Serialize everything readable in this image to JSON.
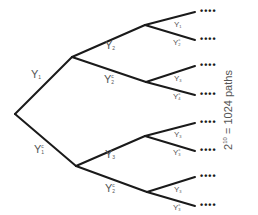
{
  "diagram": {
    "type": "binary-tree",
    "edge_color": "#1a1a1a",
    "label_color": "#555555",
    "root": {
      "x": 15,
      "y": 114
    },
    "level1": [
      {
        "label": "Y",
        "sub": "1",
        "sup": "",
        "from": [
          15,
          114
        ],
        "to": [
          72,
          57
        ],
        "lx": 37,
        "ly": 72
      },
      {
        "label": "Y",
        "sub": "1",
        "sup": "c",
        "from": [
          15,
          114
        ],
        "to": [
          76,
          166
        ],
        "lx": 40,
        "ly": 147
      }
    ],
    "level2": [
      {
        "label": "Y",
        "sub": "2",
        "sup": "",
        "from": [
          72,
          57
        ],
        "to": [
          145,
          25
        ],
        "lx": 111,
        "ly": 43
      },
      {
        "label": "Y",
        "sub": "2",
        "sup": "c",
        "from": [
          72,
          57
        ],
        "to": [
          146,
          82
        ],
        "lx": 110,
        "ly": 77
      },
      {
        "label": "Y",
        "sub": "3",
        "sup": "",
        "from": [
          76,
          166
        ],
        "to": [
          145,
          136
        ],
        "lx": 111,
        "ly": 152
      },
      {
        "label": "Y",
        "sub": "2",
        "sup": "c",
        "from": [
          76,
          166
        ],
        "to": [
          147,
          192
        ],
        "lx": 111,
        "ly": 186
      }
    ],
    "level3": [
      {
        "label": "Y",
        "sub": "1",
        "sup": "",
        "from": [
          145,
          25
        ],
        "to": [
          195,
          12
        ],
        "lx": 178,
        "ly": 19
      },
      {
        "label": "Y",
        "sub": "2",
        "sup": "c",
        "from": [
          145,
          25
        ],
        "to": [
          195,
          40
        ],
        "lx": 177,
        "ly": 37
      },
      {
        "label": "Y",
        "sub": "3",
        "sup": "",
        "from": [
          146,
          82
        ],
        "to": [
          195,
          66
        ],
        "lx": 178,
        "ly": 73
      },
      {
        "label": "Y",
        "sub": "4",
        "sup": "c",
        "from": [
          146,
          82
        ],
        "to": [
          195,
          95
        ],
        "lx": 177,
        "ly": 91
      },
      {
        "label": "Y",
        "sub": "3",
        "sup": "",
        "from": [
          145,
          136
        ],
        "to": [
          195,
          123
        ],
        "lx": 178,
        "ly": 129
      },
      {
        "label": "Y",
        "sub": "3",
        "sup": "c",
        "from": [
          145,
          136
        ],
        "to": [
          195,
          151
        ],
        "lx": 177,
        "ly": 147
      },
      {
        "label": "Y",
        "sub": "3",
        "sup": "",
        "from": [
          147,
          192
        ],
        "to": [
          195,
          177
        ],
        "lx": 178,
        "ly": 184
      },
      {
        "label": "Y",
        "sub": "3",
        "sup": "c",
        "from": [
          147,
          192
        ],
        "to": [
          195,
          206
        ],
        "lx": 177,
        "ly": 202
      }
    ],
    "continuation_dots": "••••",
    "leaf_y": [
      12,
      40,
      66,
      95,
      123,
      151,
      177,
      206
    ],
    "paths_note": {
      "base": "2",
      "exponent": "10",
      "text": " = 1024 paths"
    }
  }
}
